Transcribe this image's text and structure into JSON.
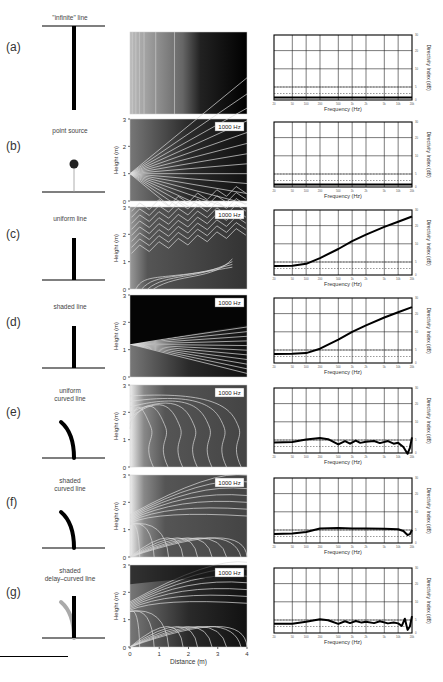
{
  "figure": {
    "rows": [
      {
        "label": "(a)",
        "source_title": "\"infinite\" line",
        "source_type": "infinite-line",
        "heatmap_label": "",
        "show_axes": false,
        "directivity": {
          "type": "flat",
          "level_db": 1
        }
      },
      {
        "label": "(b)",
        "source_title": "point source",
        "source_type": "point",
        "heatmap_label": "1000 Hz",
        "show_axes": true,
        "directivity": {
          "type": "flat",
          "level_db": 1
        }
      },
      {
        "label": "(c)",
        "source_title": "uniform line",
        "source_type": "line",
        "heatmap_label": "1000 Hz",
        "show_axes": true,
        "directivity": {
          "type": "rising",
          "points": [
            [
              20,
              3.5
            ],
            [
              50,
              3.6
            ],
            [
              100,
              4.3
            ],
            [
              200,
              6.5
            ],
            [
              500,
              10
            ],
            [
              1000,
              13
            ],
            [
              2000,
              15.5
            ],
            [
              5000,
              18.5
            ],
            [
              10000,
              20.5
            ],
            [
              20000,
              22.5
            ]
          ]
        }
      },
      {
        "label": "(d)",
        "source_title": "shaded line",
        "source_type": "line",
        "heatmap_label": "1000 Hz",
        "show_axes": true,
        "directivity": {
          "type": "rising",
          "points": [
            [
              20,
              3.5
            ],
            [
              50,
              3.6
            ],
            [
              100,
              3.8
            ],
            [
              200,
              5.5
            ],
            [
              500,
              9
            ],
            [
              1000,
              12
            ],
            [
              2000,
              14.5
            ],
            [
              5000,
              17.5
            ],
            [
              10000,
              19.5
            ],
            [
              20000,
              21.5
            ]
          ]
        }
      },
      {
        "label": "(e)",
        "source_title": "uniform\ncurved line",
        "source_type": "curved",
        "heatmap_label": "1000 Hz",
        "show_axes": true,
        "directivity": {
          "type": "wavy",
          "points": [
            [
              20,
              4
            ],
            [
              50,
              4.2
            ],
            [
              100,
              5.2
            ],
            [
              200,
              5.8
            ],
            [
              300,
              5.3
            ],
            [
              500,
              3.3
            ],
            [
              700,
              4.6
            ],
            [
              900,
              3.6
            ],
            [
              1200,
              4.8
            ],
            [
              1500,
              3.9
            ],
            [
              2000,
              4.3
            ],
            [
              3000,
              4.6
            ],
            [
              4000,
              3.8
            ],
            [
              6000,
              4.6
            ],
            [
              8000,
              3.6
            ],
            [
              10000,
              3.9
            ],
            [
              13000,
              2.3
            ],
            [
              16000,
              -0.3
            ],
            [
              18000,
              2
            ],
            [
              20000,
              6
            ]
          ]
        }
      },
      {
        "label": "(f)",
        "source_title": "shaded\ncurved line",
        "source_type": "curved",
        "heatmap_label": "1000 Hz",
        "show_axes": true,
        "directivity": {
          "type": "smooth",
          "points": [
            [
              20,
              3.5
            ],
            [
              50,
              3.7
            ],
            [
              100,
              4.2
            ],
            [
              200,
              5.6
            ],
            [
              500,
              5.8
            ],
            [
              1000,
              5.6
            ],
            [
              2000,
              5.6
            ],
            [
              5000,
              5.5
            ],
            [
              10000,
              5.3
            ],
            [
              13000,
              4.6
            ],
            [
              16000,
              3.1
            ],
            [
              18000,
              3.4
            ],
            [
              20000,
              5
            ]
          ]
        }
      },
      {
        "label": "(g)",
        "source_title": "shaded\ndelay–curved line",
        "source_type": "delay-curved",
        "heatmap_label": "1000 Hz",
        "show_axes": true,
        "directivity": {
          "type": "wavy",
          "points": [
            [
              20,
              3.6
            ],
            [
              50,
              3.6
            ],
            [
              100,
              4.3
            ],
            [
              200,
              5.3
            ],
            [
              300,
              4.9
            ],
            [
              500,
              3.5
            ],
            [
              700,
              4.5
            ],
            [
              900,
              3.8
            ],
            [
              1200,
              4.6
            ],
            [
              1600,
              4
            ],
            [
              2000,
              4.3
            ],
            [
              3000,
              3.8
            ],
            [
              4000,
              4.5
            ],
            [
              6000,
              3.7
            ],
            [
              8000,
              4
            ],
            [
              10000,
              3.7
            ],
            [
              12000,
              2.7
            ],
            [
              14000,
              5.5
            ],
            [
              16000,
              1.2
            ],
            [
              18000,
              2.5
            ],
            [
              20000,
              6.5
            ]
          ]
        }
      }
    ],
    "heatmap_axes": {
      "ylabel": "Height (m)",
      "xlabel": "Distance (m)",
      "y_ticks": [
        "0",
        "1",
        "2",
        "3"
      ],
      "x_ticks": [
        "0",
        "1",
        "2",
        "3",
        "4"
      ]
    },
    "directivity_axes": {
      "xlabel": "Frequency (Hz)",
      "ylabel": "Directivity Index (dB)",
      "x_ticks": [
        "20",
        "50",
        "100",
        "200",
        "500",
        "1k",
        "2k",
        "5k",
        "10k",
        "20k"
      ],
      "y_ticks": [
        "0",
        "5",
        "10",
        "20",
        "30"
      ],
      "dashed_ref_db": [
        2.5,
        5
      ]
    }
  },
  "chart_data": {
    "type": "line",
    "xlabel": "Frequency (Hz)",
    "ylabel": "Directivity Index (dB)",
    "xscale": "log",
    "xlim": [
      20,
      20000
    ],
    "ylim": [
      0,
      25
    ],
    "grid": true,
    "series": [
      {
        "name": "(a) \"infinite\" line",
        "x": [
          20,
          20000
        ],
        "y": [
          1,
          1
        ]
      },
      {
        "name": "(b) point source",
        "x": [
          20,
          20000
        ],
        "y": [
          1,
          1
        ]
      },
      {
        "name": "(c) uniform line",
        "x": [
          20,
          50,
          100,
          200,
          500,
          1000,
          2000,
          5000,
          10000,
          20000
        ],
        "y": [
          3.5,
          3.6,
          4.3,
          6.5,
          10,
          13,
          15.5,
          18.5,
          20.5,
          22.5
        ]
      },
      {
        "name": "(d) shaded line",
        "x": [
          20,
          50,
          100,
          200,
          500,
          1000,
          2000,
          5000,
          10000,
          20000
        ],
        "y": [
          3.5,
          3.6,
          3.8,
          5.5,
          9,
          12,
          14.5,
          17.5,
          19.5,
          21.5
        ]
      },
      {
        "name": "(e) uniform curved line",
        "x": [
          20,
          50,
          100,
          200,
          500,
          1000,
          2000,
          5000,
          10000,
          16000,
          20000
        ],
        "y": [
          4,
          4.2,
          5.2,
          5.8,
          3.3,
          4.3,
          4.3,
          4.2,
          3.9,
          -0.3,
          6
        ]
      },
      {
        "name": "(f) shaded curved line",
        "x": [
          20,
          50,
          100,
          200,
          500,
          1000,
          2000,
          5000,
          10000,
          16000,
          20000
        ],
        "y": [
          3.5,
          3.7,
          4.2,
          5.6,
          5.8,
          5.6,
          5.6,
          5.5,
          5.3,
          3.1,
          5
        ]
      },
      {
        "name": "(g) shaded delay-curved line",
        "x": [
          20,
          50,
          100,
          200,
          500,
          1000,
          2000,
          5000,
          10000,
          16000,
          20000
        ],
        "y": [
          3.6,
          3.6,
          4.3,
          5.3,
          3.5,
          4.2,
          4.3,
          3.9,
          3.7,
          1.2,
          6.5
        ]
      }
    ]
  }
}
